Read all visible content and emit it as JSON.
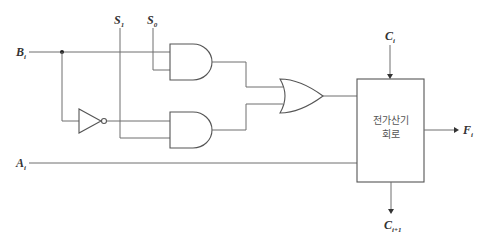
{
  "diagram": {
    "inputs": {
      "b": {
        "main": "B",
        "sub": "i"
      },
      "a": {
        "main": "A",
        "sub": "i"
      },
      "s1": {
        "main": "S",
        "sub": "1"
      },
      "s0": {
        "main": "S",
        "sub": "0"
      },
      "c_in": {
        "main": "C",
        "sub": "i"
      }
    },
    "outputs": {
      "f": {
        "main": "F",
        "sub": "i"
      },
      "c_out": {
        "main": "C",
        "sub": "i+1"
      }
    },
    "adder_block": {
      "line1": "전가산기",
      "line2": "회로"
    },
    "components": [
      "NOT gate",
      "AND gate (top)",
      "AND gate (bottom)",
      "OR gate",
      "Full adder circuit"
    ],
    "colors": {
      "line": "#6e6e6e",
      "text": "#333333"
    }
  }
}
